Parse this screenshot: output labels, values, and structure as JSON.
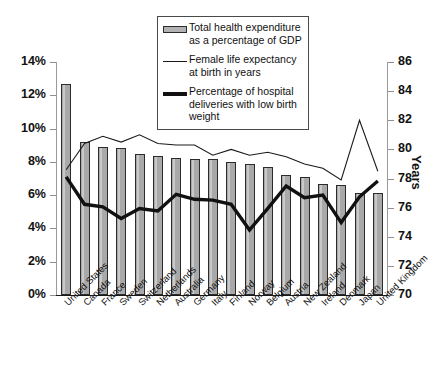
{
  "chart_data": {
    "type": "bar",
    "title": "",
    "xlabel": "",
    "ylabel": "",
    "ylabel_right": "Years",
    "grid": false,
    "legend_position": "top-center",
    "ylim": [
      0,
      14
    ],
    "ylim_right": [
      70,
      86
    ],
    "categories": [
      "United States",
      "Canada",
      "France",
      "Sweden",
      "Switzerland",
      "Netherlands",
      "Australia",
      "Germany",
      "Italy",
      "Finland",
      "Norway",
      "Belgium",
      "Austria",
      "New Zealand",
      "Ireland",
      "Denmark",
      "Japan",
      "United Kingdom"
    ],
    "yticks_left": [
      "0%",
      "2%",
      "4%",
      "6%",
      "8%",
      "10%",
      "12%",
      "14%"
    ],
    "yticks_left_values": [
      0,
      2,
      4,
      6,
      8,
      10,
      12,
      14
    ],
    "yticks_right": [
      "70",
      "72",
      "74",
      "76",
      "78",
      "80",
      "82",
      "84",
      "86"
    ],
    "yticks_right_values": [
      70,
      72,
      74,
      76,
      78,
      80,
      82,
      84,
      86
    ],
    "series": [
      {
        "name": "Total health expenditure as a percentage of GDP",
        "type": "bar",
        "axis": "left",
        "unit": "%",
        "color": "#a9a9a9",
        "values": [
          12.7,
          9.2,
          8.9,
          8.85,
          8.45,
          8.35,
          8.25,
          8.2,
          8.2,
          8.0,
          7.9,
          7.7,
          7.2,
          7.1,
          6.7,
          6.6,
          6.15,
          6.15
        ]
      },
      {
        "name": "Female life expectancy at birth in years",
        "type": "line",
        "axis": "right",
        "unit": "years",
        "color": "#1a1a1a",
        "values": [
          78.6,
          80.4,
          80.9,
          80.5,
          81.0,
          80.4,
          80.3,
          80.3,
          79.6,
          80.0,
          79.6,
          79.8,
          79.5,
          79.0,
          78.7,
          77.9,
          82.0,
          78.5
        ]
      },
      {
        "name": "Percentage of hospital deliveries with low birth weight",
        "type": "line",
        "axis": "left",
        "unit": "%",
        "color": "#111111",
        "values": [
          7.1,
          5.45,
          5.3,
          4.6,
          5.2,
          5.05,
          6.05,
          5.75,
          5.7,
          5.45,
          3.9,
          5.2,
          6.55,
          5.85,
          6.0,
          4.35,
          5.9,
          6.85
        ]
      }
    ]
  },
  "legend": {
    "items": [
      {
        "key": "bar-swatch",
        "text_line1": "Total health expenditure",
        "text_line2": "as a percentage of GDP"
      },
      {
        "key": "thin-line",
        "text_line1": "Female life expectancy",
        "text_line2": "at birth in years"
      },
      {
        "key": "thick-line",
        "text_line1": "Percentage of hospital",
        "text_line2": "deliveries with low birth",
        "text_line3": "weight"
      }
    ]
  },
  "axes": {
    "right_title": "Years"
  },
  "colors": {
    "bar_fill": "#a9a9a9",
    "bar_stroke": "#2b2b2b",
    "thin_line": "#1a1a1a",
    "thick_line": "#111111",
    "axis": "#9a9a9a",
    "text": "#111111",
    "background": "#ffffff"
  }
}
